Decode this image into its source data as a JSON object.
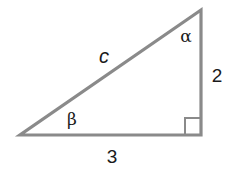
{
  "diagram": {
    "type": "right-triangle",
    "colors": {
      "stroke": "#8a8a8a",
      "text": "#1a1a1a",
      "background": "#ffffff"
    },
    "vertices": {
      "bottom_left": [
        20,
        135
      ],
      "bottom_right": [
        201,
        135
      ],
      "top_right": [
        201,
        10
      ]
    },
    "right_angle_marker": {
      "corner": "bottom_right",
      "size": 16
    },
    "labels": {
      "hypotenuse": "c",
      "vertical_side": "2",
      "horizontal_side": "3",
      "top_angle": "α",
      "left_angle": "β"
    }
  }
}
